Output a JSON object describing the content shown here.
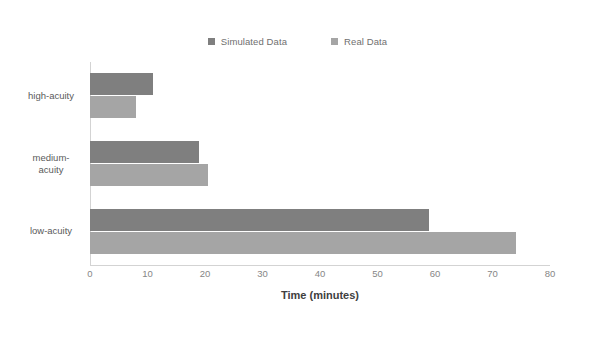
{
  "chart_data": {
    "type": "bar",
    "orientation": "horizontal",
    "title": "",
    "xlabel": "Time (minutes)",
    "ylabel": "Acuity levels",
    "categories": [
      "high-acuity",
      "medium-acuity",
      "low-acuity"
    ],
    "category_label_lines": [
      [
        "high-acuity"
      ],
      [
        "medium-",
        "acuity"
      ],
      [
        "low-acuity"
      ]
    ],
    "series": [
      {
        "name": "Simulated Data",
        "color": "#7f7f7f",
        "values": [
          11,
          19,
          59
        ]
      },
      {
        "name": "Real Data",
        "color": "#a5a5a5",
        "values": [
          8,
          20.5,
          74
        ]
      }
    ],
    "xlim": [
      0,
      80
    ],
    "xticks": [
      0,
      10,
      20,
      30,
      40,
      50,
      60,
      70,
      80
    ],
    "xtick_labels": [
      "0",
      "10",
      "20",
      "30",
      "40",
      "50",
      "60",
      "70",
      "80"
    ],
    "grid": false,
    "legend_position": "top-center"
  },
  "legend": {
    "entries": [
      {
        "label": "Simulated Data",
        "color": "#7f7f7f"
      },
      {
        "label": "Real Data",
        "color": "#a5a5a5"
      }
    ]
  }
}
